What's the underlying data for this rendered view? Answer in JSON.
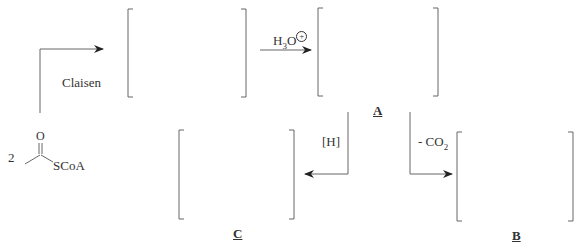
{
  "scheme": {
    "reagents": {
      "claisen": "Claisen",
      "h3o": "H",
      "h3o_sub": "3",
      "h3o_o": "O",
      "h3o_charge": "+",
      "reduction": "[H]",
      "decarboxylation": "- CO",
      "decarboxylation_sub": "2"
    },
    "starting_material": {
      "coefficient": "2",
      "oxygen": "O",
      "thioester": "SCoA"
    },
    "labels": {
      "A": "A",
      "B": "B",
      "C": "C"
    }
  },
  "colors": {
    "line": "#555555",
    "text": "#333333"
  }
}
